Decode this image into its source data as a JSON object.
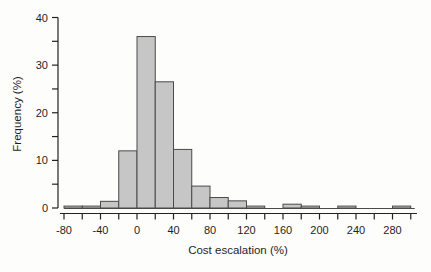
{
  "chart_data": {
    "type": "bar",
    "subtype": "histogram",
    "title": "",
    "xlabel": "Cost escalation (%)",
    "ylabel": "Frequency (%)",
    "bin_width": 20,
    "bin_edges": [
      -80,
      -60,
      -40,
      -20,
      0,
      20,
      40,
      60,
      80,
      100,
      120,
      140,
      160,
      180,
      200,
      220,
      240,
      260,
      280,
      300
    ],
    "values": [
      0.4,
      0.4,
      1.4,
      12,
      36,
      26.5,
      12.3,
      4.6,
      2.2,
      1.5,
      0.4,
      0,
      0.8,
      0.4,
      0,
      0.4,
      0,
      0,
      0.4
    ],
    "xlim": [
      -80,
      300
    ],
    "ylim": [
      0,
      40
    ],
    "x_major_ticks": [
      -80,
      -40,
      0,
      40,
      80,
      120,
      160,
      200,
      240,
      280
    ],
    "x_major_tick_labels": [
      "-80",
      "-40",
      "0",
      "40",
      "80",
      "120",
      "160",
      "200",
      "240",
      "280"
    ],
    "x_minor_tick_step": 20,
    "y_major_ticks": [
      0,
      10,
      20,
      30,
      40
    ],
    "y_major_tick_labels": [
      "0",
      "10",
      "20",
      "30",
      "40"
    ],
    "y_minor_tick_step": 5,
    "grid": "off",
    "legend": "none",
    "colors": {
      "bar_fill": "#c6c6c6",
      "bar_stroke": "#4a4a4a",
      "axis": "#222222",
      "text": "#1f1f1f",
      "background": "#fdfdfc"
    }
  }
}
